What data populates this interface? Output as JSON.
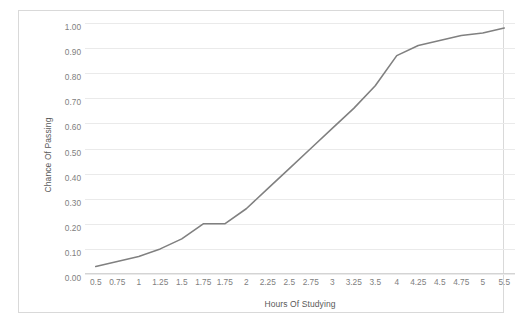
{
  "chart_data": {
    "type": "line",
    "title": "",
    "xlabel": "Hours Of Studying",
    "ylabel": "Chance Of Passing",
    "categories": [
      "0.5",
      "0.75",
      "1",
      "1.25",
      "1.5",
      "1.75",
      "1.75",
      "2",
      "2.25",
      "2.5",
      "2.75",
      "3",
      "3.25",
      "3.5",
      "4",
      "4.25",
      "4.5",
      "4.75",
      "5",
      "5.5"
    ],
    "values": [
      0.03,
      0.05,
      0.07,
      0.1,
      0.14,
      0.2,
      0.2,
      0.26,
      0.34,
      0.42,
      0.5,
      0.58,
      0.66,
      0.75,
      0.87,
      0.91,
      0.93,
      0.95,
      0.96,
      0.98
    ],
    "series": [
      {
        "name": "Chance Of Passing",
        "values": [
          0.03,
          0.05,
          0.07,
          0.1,
          0.14,
          0.2,
          0.2,
          0.26,
          0.34,
          0.42,
          0.5,
          0.58,
          0.66,
          0.75,
          0.87,
          0.91,
          0.93,
          0.95,
          0.96,
          0.98
        ],
        "color": "#808080"
      }
    ],
    "y_tick_labels": [
      "1.00",
      "0.90",
      "0.80",
      "0.70",
      "0.60",
      "0.50",
      "0.40",
      "0.30",
      "0.20",
      "0.10",
      "0.00"
    ],
    "y_tick_values": [
      1.0,
      0.9,
      0.8,
      0.7,
      0.6,
      0.5,
      0.4,
      0.3,
      0.2,
      0.1,
      0.0
    ],
    "ylim": [
      0.0,
      1.0
    ],
    "grid": true,
    "grid_axis": "y",
    "legend": false,
    "legend_position": "none",
    "line_color": "#808080",
    "grid_color": "#eaeaea",
    "border_color": "#d9d9d9",
    "tick_label_color": "#808080",
    "axis_title_color": "#595959",
    "markers": false
  }
}
